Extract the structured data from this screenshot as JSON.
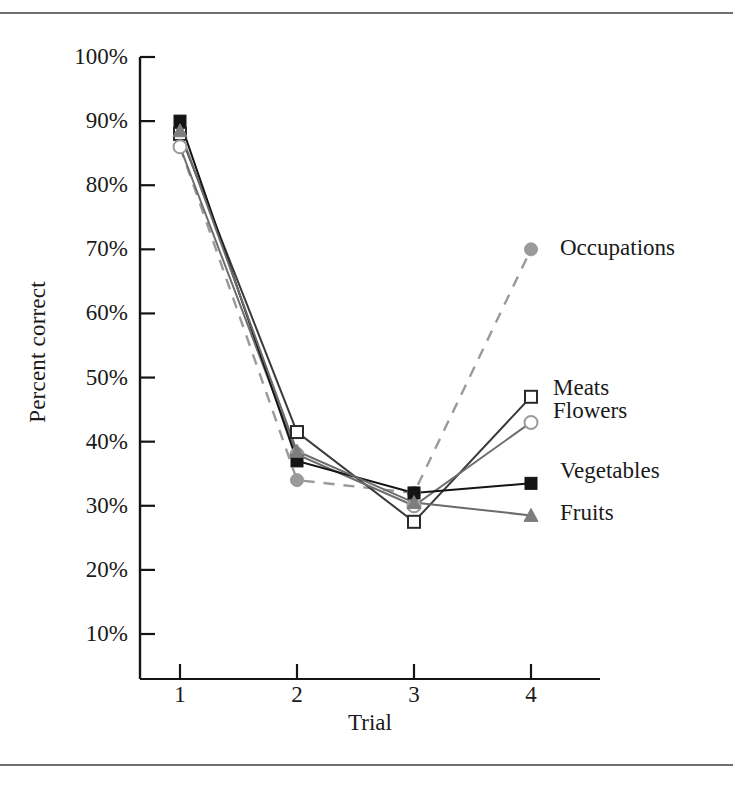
{
  "figure": {
    "has_top_rule": true,
    "has_bottom_rule": true
  },
  "axes": {
    "x_title": "Trial",
    "y_title": "Percent correct",
    "x_tick_labels": [
      "1",
      "2",
      "3",
      "4"
    ],
    "y_tick_labels": [
      "100%",
      "90%",
      "80%",
      "70%",
      "60%",
      "50%",
      "40%",
      "30%",
      "20%",
      "10%"
    ]
  },
  "labels": {
    "occupations": "Occupations",
    "meats": "Meats",
    "flowers": "Flowers",
    "vegetables": "Vegetables",
    "fruits": "Fruits"
  },
  "colors": {
    "axis": "#141414",
    "dark": "#242424",
    "mid_gray": "#606060",
    "light_gray": "#9a9a9a",
    "marker_gray": "#8a8a8a"
  },
  "chart_data": {
    "type": "line",
    "title": "",
    "xlabel": "Trial",
    "ylabel": "Percent correct",
    "x": [
      1,
      2,
      3,
      4
    ],
    "xlim": [
      0.55,
      4.6
    ],
    "ylim": [
      10,
      100
    ],
    "yticks": [
      10,
      20,
      30,
      40,
      50,
      60,
      70,
      80,
      90,
      100
    ],
    "ytick_format": "percent",
    "grid": false,
    "legend": "inline-right-of-endpoints",
    "series": [
      {
        "name": "Occupations",
        "values": [
          86,
          34,
          32,
          70
        ],
        "marker": "circle-filled-gray",
        "line_style": "dashed",
        "color": "#9a9a9a"
      },
      {
        "name": "Meats",
        "values": [
          88,
          41.5,
          27.5,
          47
        ],
        "marker": "square-open",
        "line_style": "solid",
        "color": "#3a3a3a"
      },
      {
        "name": "Flowers",
        "values": [
          86,
          38,
          30,
          43
        ],
        "marker": "circle-open",
        "line_style": "solid",
        "color": "#6e6e6e"
      },
      {
        "name": "Vegetables",
        "values": [
          90,
          37,
          32,
          33.5
        ],
        "marker": "square-filled",
        "line_style": "solid",
        "color": "#141414"
      },
      {
        "name": "Fruits",
        "values": [
          88.5,
          38.5,
          30.5,
          28.5
        ],
        "marker": "triangle-filled-gray",
        "line_style": "solid",
        "color": "#6b6b6b"
      }
    ]
  }
}
